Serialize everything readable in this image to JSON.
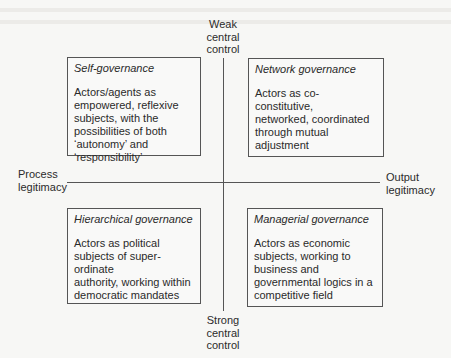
{
  "diagram": {
    "axes": {
      "top": [
        "Weak",
        "central",
        "control"
      ],
      "bottom": [
        "Strong",
        "central",
        "control"
      ],
      "left": [
        "Process",
        "legitimacy"
      ],
      "right": [
        "Output",
        "legitimacy"
      ]
    },
    "quadrants": {
      "top_left": {
        "title": "Self-governance",
        "lines": [
          "Actors/agents as",
          "empowered, reflexive",
          "subjects, with the",
          "possibilities of both",
          "‘autonomy’ and",
          "‘responsibility’"
        ]
      },
      "top_right": {
        "title": "Network governance",
        "lines": [
          "Actors as co-constitutive,",
          "networked, coordinated",
          "through mutual adjustment"
        ]
      },
      "bottom_left": {
        "title": "Hierarchical governance",
        "lines": [
          "Actors as political",
          "subjects of super-ordinate",
          "authority, working within",
          "democratic mandates"
        ]
      },
      "bottom_right": {
        "title": "Managerial governance",
        "lines": [
          "Actors as economic",
          "subjects, working to",
          "business and",
          "governmental logics in a",
          "competitive field"
        ]
      }
    }
  }
}
